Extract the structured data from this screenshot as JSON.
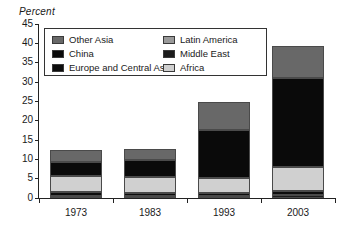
{
  "chart_data": {
    "type": "bar",
    "subtype": "stacked-bar",
    "title": "",
    "xlabel": "",
    "ylabel": "Percent",
    "ylim": [
      0,
      45
    ],
    "ytick_step": 5,
    "yticks": [
      0,
      5,
      10,
      15,
      20,
      25,
      30,
      35,
      40,
      45
    ],
    "grid": false,
    "legend_position": "upper-left-inside",
    "categories": [
      "1973",
      "1983",
      "1993",
      "2003"
    ],
    "stack_order_bottom_to_top": [
      "Middle East",
      "Europe and Central Asia",
      "Africa",
      "Latin America",
      "China",
      "Other Asia"
    ],
    "series": [
      {
        "name": "Middle East",
        "color": "#1c1c1c",
        "values": [
          0.4,
          0.5,
          0.6,
          0.7
        ]
      },
      {
        "name": "Europe and Central Asia",
        "color": "#0d0d0d",
        "values": [
          1.2,
          0.9,
          0.7,
          1.0
        ]
      },
      {
        "name": "Africa",
        "color": "#d0d0d0",
        "values": [
          4.2,
          4.1,
          4.0,
          6.2
        ]
      },
      {
        "name": "Latin America",
        "color": "#9a9a9a",
        "values": [
          0.0,
          0.0,
          0.0,
          0.0
        ]
      },
      {
        "name": "China",
        "color": "#0a0a0a",
        "values": [
          3.6,
          4.4,
          12.4,
          23.1
        ]
      },
      {
        "name": "Other Asia",
        "color": "#686868",
        "values": [
          2.9,
          2.9,
          7.2,
          8.3
        ]
      }
    ],
    "totals": [
      12.3,
      12.8,
      24.9,
      39.3
    ]
  },
  "legend": {
    "left_column": [
      {
        "label": "Other Asia",
        "color": "#686868"
      },
      {
        "label": "China",
        "color": "#0a0a0a"
      },
      {
        "label": "Europe and Central Asia",
        "color": "#0d0d0d"
      }
    ],
    "right_column": [
      {
        "label": "Latin America",
        "color": "#9a9a9a"
      },
      {
        "label": "Middle East",
        "color": "#1c1c1c"
      },
      {
        "label": "Africa",
        "color": "#d0d0d0"
      }
    ]
  },
  "axis": {
    "y_title": "Percent",
    "y_tick_labels": [
      "45",
      "40",
      "35",
      "30",
      "25",
      "20",
      "15",
      "10",
      "5",
      "0"
    ],
    "x_tick_labels": [
      "1973",
      "1983",
      "1993",
      "2003"
    ]
  },
  "style": {
    "axis_color": "#222222",
    "bar_edge_color": "#4a4a4a",
    "background": "#ffffff"
  }
}
